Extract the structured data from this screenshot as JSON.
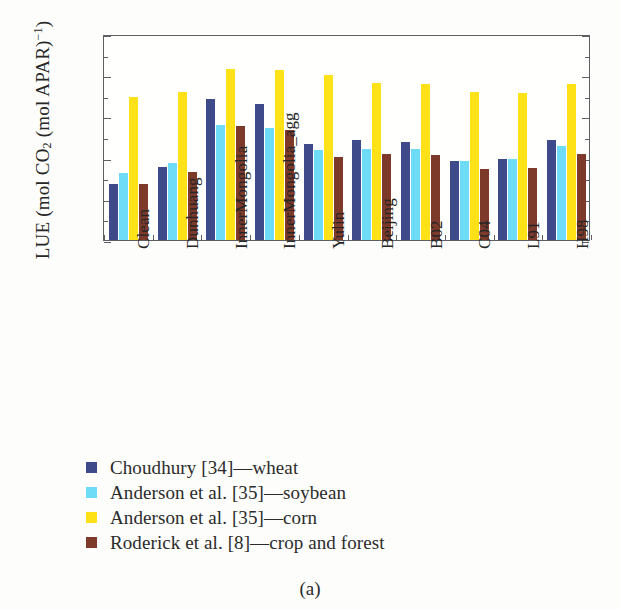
{
  "figure": {
    "caption": "(a)"
  },
  "axes": {
    "ylabel_prefix": "LUE (mol CO",
    "ylabel_sub": "2",
    "ylabel_mid": " (mol APAR)",
    "ylabel_sup": "−1",
    "ylabel_suffix": ")",
    "ylabel_full": "LUE (mol CO2 (mol APAR)−1)",
    "ytick_labels": [
      "0.05",
      "0.04",
      "0.03",
      "0.02",
      "0.01",
      "0"
    ],
    "ytick_values": [
      0.05,
      0.04,
      0.03,
      0.02,
      0.01,
      0
    ],
    "yminor_values": [
      0.045,
      0.035,
      0.025,
      0.015,
      0.005
    ]
  },
  "colors": {
    "wheat": "#3f4a8a",
    "soybean": "#6edcf7",
    "corn": "#ffe117",
    "crop_forest": "#7d3a2b",
    "axis": "#5d5f63",
    "text": "#2b2b2b",
    "background": "#fdfdfb"
  },
  "legend": {
    "items": [
      {
        "label": "Choudhury [34]—wheat",
        "color": "#3f4a8a",
        "swatch": "legend-swatch-wheat"
      },
      {
        "label": "Anderson et al. [35]—soybean",
        "color": "#6edcf7",
        "swatch": "legend-swatch-soybean"
      },
      {
        "label": "Anderson et al. [35]—corn",
        "color": "#ffe117",
        "swatch": "legend-swatch-corn"
      },
      {
        "label": "Roderick et al. [8]—crop and forest",
        "color": "#7d3a2b",
        "swatch": "legend-swatch-crop-forest"
      }
    ]
  },
  "chart_data": {
    "type": "bar",
    "title": "",
    "subtitle": "",
    "xlabel": "",
    "ylabel": "LUE (mol CO2 (mol APAR)−1)",
    "ylim": [
      0,
      0.05
    ],
    "ytick_step": 0.01,
    "grid": false,
    "legend_position": "below-plot",
    "categories": [
      "Clean",
      "Dunhuang",
      "InnerMongolia",
      "InnerMongolia_agg",
      "Yulin",
      "Beijing",
      "B02",
      "C04",
      "L91",
      "H98"
    ],
    "series": [
      {
        "name": "Choudhury [34]—wheat",
        "color": "#3f4a8a",
        "values": [
          0.0135,
          0.0178,
          0.0342,
          0.0331,
          0.0232,
          0.0243,
          0.0239,
          0.0191,
          0.0196,
          0.0243
        ]
      },
      {
        "name": "Anderson et al. [35]—soybean",
        "color": "#6edcf7",
        "values": [
          0.0163,
          0.0187,
          0.0279,
          0.0271,
          0.0219,
          0.022,
          0.0222,
          0.0192,
          0.0197,
          0.0227
        ]
      },
      {
        "name": "Anderson et al. [35]—corn",
        "color": "#ffe117",
        "values": [
          0.0348,
          0.036,
          0.0415,
          0.0412,
          0.04,
          0.038,
          0.0379,
          0.0359,
          0.0358,
          0.0378
        ]
      },
      {
        "name": "Roderick et al. [8]—crop and forest",
        "color": "#7d3a2b",
        "values": [
          0.0137,
          0.0166,
          0.0277,
          0.0267,
          0.0202,
          0.0208,
          0.0206,
          0.0173,
          0.0174,
          0.0208
        ]
      }
    ]
  }
}
